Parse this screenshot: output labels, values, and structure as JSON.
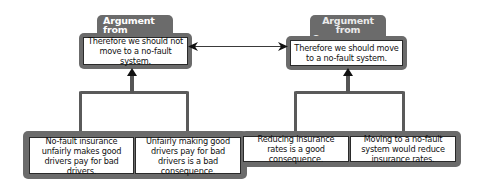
{
  "diagram": {
    "left": {
      "scheme_label": "Argument from Consequences",
      "conclusion": "Therefore we should not move to a no-fault system.",
      "premises": [
        "No-fault insurance unfairly makes good drivers pay for bad drivers.",
        "Unfairly making good drivers pay for bad drivers is a bad consequence."
      ]
    },
    "right": {
      "scheme_label": "Argument from Consequences",
      "conclusion": "Therefore we should move to a no-fault system.",
      "premises": [
        "Reducing insurance rates is a good consequence.",
        "Moving to a no-fault system would reduce insurance rates."
      ]
    },
    "relation": "conflict (bidirectional arrow)",
    "colors": {
      "frame": "#6b6b6b",
      "box_border": "#2a2a2a",
      "box_fill": "#ffffff"
    }
  }
}
